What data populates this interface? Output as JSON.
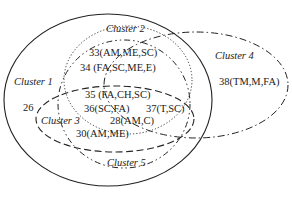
{
  "clusters": [
    {
      "id": 1,
      "label": "Cluster 1",
      "line_style": "solid"
    },
    {
      "id": 2,
      "label": "Cluster 2",
      "line_style": "dotted"
    },
    {
      "id": 3,
      "label": "Cluster 3",
      "line_style": "dashed"
    },
    {
      "id": 4,
      "label": "Cluster 4",
      "line_style": "dash-dot"
    },
    {
      "id": 5,
      "label": "Cluster 5",
      "line_style": "dash-dot-dot"
    }
  ],
  "nodes": [
    {
      "label": "33(AM,ME,SC)"
    },
    {
      "label": "34 (FA,SC,ME,E)"
    },
    {
      "label": "35 (FA,CH,SC)"
    },
    {
      "label": "36(SC,FA)"
    },
    {
      "label": "37(T,SC)"
    },
    {
      "label": "28(AM,C)"
    },
    {
      "label": "30(AM,ME)"
    },
    {
      "label": "26"
    },
    {
      "label": "38(TM,M,FA)"
    }
  ],
  "colors": {
    "stroke": "#222222",
    "background": "#ffffff"
  }
}
